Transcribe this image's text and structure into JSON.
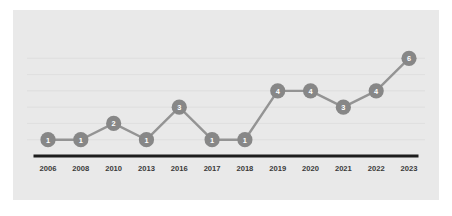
{
  "chart_data": {
    "type": "line",
    "title": "",
    "subtitle": "",
    "xlabel": "",
    "ylabel": "",
    "categories": [
      "2006",
      "2008",
      "2010",
      "2013",
      "2016",
      "2017",
      "2018",
      "2019",
      "2020",
      "2021",
      "2022",
      "2023"
    ],
    "values": [
      1,
      1,
      2,
      1,
      3,
      1,
      1,
      4,
      4,
      3,
      4,
      6
    ],
    "point_labels": [
      "1",
      "1",
      "2",
      "1",
      "3",
      "1",
      "1",
      "4",
      "4",
      "3",
      "4",
      "6"
    ],
    "ylim": [
      0,
      7
    ],
    "grid": true,
    "gridlines_y": [
      1,
      2,
      3,
      4,
      5,
      6
    ],
    "legend": false,
    "legend_position": "none",
    "annotations": [],
    "series": [
      {
        "name": "",
        "values": [
          1,
          1,
          2,
          1,
          3,
          1,
          1,
          4,
          4,
          3,
          4,
          6
        ]
      }
    ]
  },
  "style": {
    "card_background": "#e9e9e9",
    "page_background": "#ffffff",
    "line_color": "#949494",
    "marker_color": "#878787",
    "marker_label_color": "#ffffff",
    "axis_color": "#1d1d1d",
    "grid_color": "#dcdcdc",
    "tick_label_color": "#3a3a3a"
  }
}
